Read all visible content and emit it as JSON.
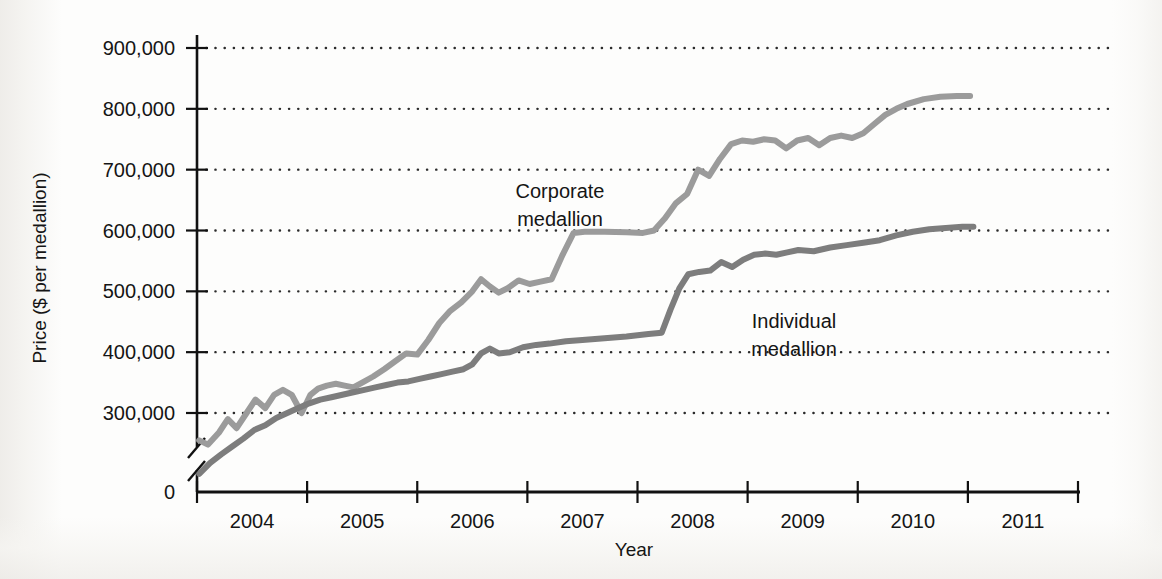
{
  "chart_data": {
    "type": "line",
    "title": "",
    "xlabel": "Year",
    "ylabel": "Price ($ per medallion)",
    "xlim": [
      2003.5,
      2011.5
    ],
    "ylim": [
      0,
      900000
    ],
    "y_axis_break": true,
    "y_break_note": "axis broken between 0 and ~230,000",
    "grid": "horizontal dotted gridlines at each labeled y tick",
    "legend": "inline labels next to each series",
    "xticks": [
      2003.5,
      2004.5,
      2005.5,
      2006.5,
      2007.5,
      2008.5,
      2009.5,
      2010.5,
      2011.5
    ],
    "xtick_labels": [
      "2004",
      "2005",
      "2006",
      "2007",
      "2008",
      "2009",
      "2010",
      "2011"
    ],
    "yticks": [
      0,
      300000,
      400000,
      500000,
      600000,
      700000,
      800000,
      900000
    ],
    "ytick_labels": [
      "0",
      "300,000",
      "400,000",
      "500,000",
      "600,000",
      "700,000",
      "800,000",
      "900,000"
    ],
    "colors": {
      "corporate": "#9b9b9b",
      "individual": "#7d7d7d",
      "axis": "#111111",
      "grid": "#2b2b2b"
    },
    "series": [
      {
        "name": "Corporate medallion",
        "label": "Corporate\nmedallion",
        "label_line1": "Corporate",
        "label_line2": "medallion",
        "color": "#9b9b9b",
        "x": [
          2003.52,
          2003.6,
          2003.7,
          2003.78,
          2003.86,
          2003.95,
          2004.03,
          2004.12,
          2004.2,
          2004.28,
          2004.36,
          2004.45,
          2004.53,
          2004.6,
          2004.68,
          2004.76,
          2004.84,
          2004.92,
          2005.0,
          2005.1,
          2005.2,
          2005.3,
          2005.4,
          2005.5,
          2005.6,
          2005.7,
          2005.8,
          2005.9,
          2006.0,
          2006.08,
          2006.16,
          2006.24,
          2006.32,
          2006.42,
          2006.52,
          2006.62,
          2006.72,
          2006.82,
          2006.92,
          2007.02,
          2007.2,
          2007.4,
          2007.55,
          2007.65,
          2007.75,
          2007.85,
          2007.95,
          2008.05,
          2008.15,
          2008.25,
          2008.35,
          2008.45,
          2008.55,
          2008.65,
          2008.75,
          2008.85,
          2008.95,
          2009.05,
          2009.15,
          2009.25,
          2009.35,
          2009.45,
          2009.55,
          2009.65,
          2009.75,
          2009.85,
          2009.95,
          2010.1,
          2010.25,
          2010.4,
          2010.52
        ],
        "y": [
          255000,
          248000,
          268000,
          290000,
          275000,
          300000,
          322000,
          308000,
          330000,
          338000,
          330000,
          300000,
          330000,
          340000,
          345000,
          348000,
          345000,
          342000,
          350000,
          360000,
          372000,
          385000,
          398000,
          396000,
          420000,
          448000,
          468000,
          482000,
          500000,
          520000,
          508000,
          498000,
          505000,
          518000,
          512000,
          516000,
          520000,
          560000,
          596000,
          598000,
          598000,
          597000,
          596000,
          600000,
          620000,
          645000,
          660000,
          700000,
          690000,
          718000,
          742000,
          748000,
          746000,
          750000,
          748000,
          735000,
          748000,
          752000,
          740000,
          752000,
          756000,
          752000,
          760000,
          775000,
          790000,
          800000,
          808000,
          816000,
          820000,
          821000,
          821000
        ]
      },
      {
        "name": "Individual medallion",
        "label": "Individual\nmedallion",
        "label_line1": "Individual",
        "label_line2": "medallion",
        "color": "#7d7d7d",
        "x": [
          2003.52,
          2003.62,
          2003.72,
          2003.82,
          2003.92,
          2004.02,
          2004.12,
          2004.22,
          2004.32,
          2004.42,
          2004.52,
          2004.62,
          2004.72,
          2004.82,
          2004.92,
          2005.02,
          2005.12,
          2005.22,
          2005.32,
          2005.42,
          2005.52,
          2005.62,
          2005.72,
          2005.82,
          2005.92,
          2006.0,
          2006.08,
          2006.16,
          2006.24,
          2006.34,
          2006.46,
          2006.58,
          2006.7,
          2006.85,
          2007.0,
          2007.2,
          2007.4,
          2007.6,
          2007.72,
          2007.8,
          2007.88,
          2007.96,
          2008.06,
          2008.16,
          2008.26,
          2008.36,
          2008.46,
          2008.56,
          2008.66,
          2008.76,
          2008.86,
          2008.96,
          2009.1,
          2009.25,
          2009.4,
          2009.55,
          2009.7,
          2009.85,
          2010.0,
          2010.15,
          2010.3,
          2010.45,
          2010.55
        ],
        "y": [
          200000,
          218000,
          232000,
          245000,
          258000,
          272000,
          280000,
          292000,
          300000,
          308000,
          316000,
          322000,
          326000,
          330000,
          334000,
          338000,
          342000,
          346000,
          350000,
          352000,
          356000,
          360000,
          364000,
          368000,
          372000,
          380000,
          398000,
          406000,
          398000,
          400000,
          408000,
          412000,
          414000,
          418000,
          420000,
          423000,
          426000,
          430000,
          432000,
          470000,
          505000,
          528000,
          532000,
          534000,
          548000,
          540000,
          552000,
          560000,
          562000,
          560000,
          564000,
          568000,
          566000,
          572000,
          576000,
          580000,
          584000,
          592000,
          598000,
          602000,
          604000,
          606000,
          606000
        ]
      }
    ]
  }
}
